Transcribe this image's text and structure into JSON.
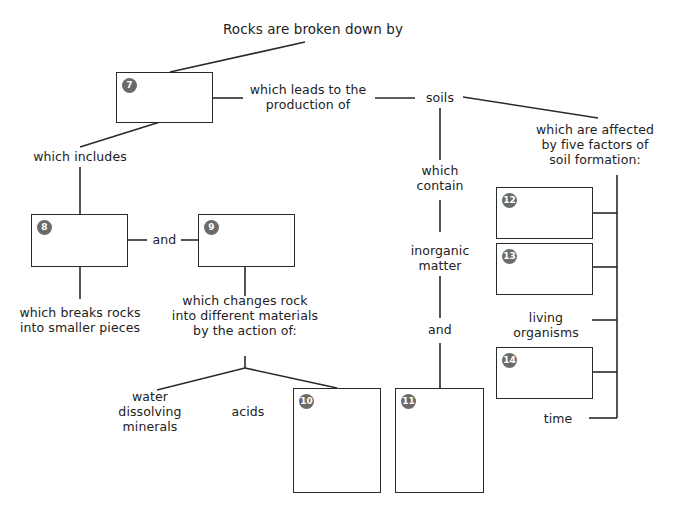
{
  "title": "Rocks are broken down by",
  "nodes": {
    "leads_to": [
      "which leads to the",
      "production of"
    ],
    "soils": "soils",
    "affected_by": [
      "which are affected",
      "by five factors of",
      "soil formation:"
    ],
    "which_includes": "which includes",
    "and_1": "and",
    "breaks_rocks": [
      "which breaks rocks",
      "into smaller pieces"
    ],
    "changes_rock": [
      "which changes rock",
      "into different materials",
      "by the action of:"
    ],
    "water": [
      "water",
      "dissolving",
      "minerals"
    ],
    "acids": "acids",
    "which_contain": [
      "which",
      "contain"
    ],
    "inorganic_matter": [
      "inorganic",
      "matter"
    ],
    "and_2": "and",
    "living_organisms": [
      "living",
      "organisms"
    ],
    "time": "time"
  },
  "boxes": {
    "b7": "7",
    "b8": "8",
    "b9": "9",
    "b10": "10",
    "b11": "11",
    "b12": "12",
    "b13": "13",
    "b14": "14"
  },
  "colors": {
    "line": "#2a2a2a",
    "badge": "#6b6b6b"
  }
}
